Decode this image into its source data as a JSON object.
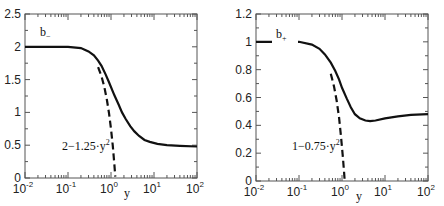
{
  "chart_data": [
    {
      "type": "line",
      "title": "",
      "xlabel": "y",
      "ylabel": "",
      "xscale": "log",
      "xlim": [
        0.01,
        100
      ],
      "ylim": [
        0,
        2.5
      ],
      "xticks": [
        "10^-2",
        "10^-1",
        "10^0",
        "10^1",
        "10^2"
      ],
      "yticks": [
        "0",
        "0.5",
        "1",
        "1.5",
        "2",
        "2.5"
      ],
      "curve_label": "b_",
      "series": [
        {
          "name": "b_",
          "style": "solid",
          "x": [
            0.01,
            0.05,
            0.1,
            0.2,
            0.3,
            0.4,
            0.5,
            0.6,
            0.75,
            0.9,
            1.2,
            1.5,
            1.8,
            2.2,
            2.8,
            3.5,
            4.5,
            6,
            8,
            12,
            20,
            40,
            100
          ],
          "y": [
            2.0,
            2.0,
            2.0,
            1.98,
            1.93,
            1.87,
            1.79,
            1.71,
            1.58,
            1.46,
            1.26,
            1.12,
            1.0,
            0.9,
            0.79,
            0.71,
            0.64,
            0.58,
            0.55,
            0.52,
            0.5,
            0.49,
            0.48
          ]
        },
        {
          "name": "2-1.25·y²",
          "style": "dashed",
          "x": [
            0.5,
            0.6,
            0.7,
            0.8,
            0.9,
            1.0,
            1.1,
            1.2,
            1.26
          ],
          "y": [
            1.69,
            1.55,
            1.39,
            1.2,
            0.99,
            0.75,
            0.49,
            0.2,
            0.02
          ]
        }
      ],
      "annotation": {
        "text": "2−1.25·y",
        "sup": "2"
      }
    },
    {
      "type": "line",
      "title": "",
      "xlabel": "y",
      "ylabel": "",
      "xscale": "log",
      "xlim": [
        0.01,
        100
      ],
      "ylim": [
        0,
        1.2
      ],
      "xticks": [
        "10^-2",
        "10^-1",
        "10^0",
        "10^1",
        "10^2"
      ],
      "yticks": [
        "0",
        "0.2",
        "0.4",
        "0.6",
        "0.8",
        "1",
        "1.2"
      ],
      "curve_label": "b+",
      "series": [
        {
          "name": "b+",
          "style": "solid",
          "x": [
            0.01,
            0.05,
            0.1,
            0.2,
            0.3,
            0.4,
            0.55,
            0.7,
            0.85,
            1.0,
            1.3,
            1.6,
            2.0,
            2.6,
            3.5,
            4.5,
            6,
            10,
            20,
            40,
            100
          ],
          "y": [
            1.0,
            1.0,
            1.0,
            0.98,
            0.95,
            0.91,
            0.85,
            0.79,
            0.73,
            0.67,
            0.59,
            0.53,
            0.48,
            0.45,
            0.435,
            0.43,
            0.435,
            0.45,
            0.465,
            0.475,
            0.48
          ]
        },
        {
          "name": "1-0.75·y²",
          "style": "dashed",
          "x": [
            0.55,
            0.65,
            0.75,
            0.85,
            0.95,
            1.05,
            1.12,
            1.155
          ],
          "y": [
            0.77,
            0.68,
            0.58,
            0.46,
            0.32,
            0.17,
            0.06,
            0.0
          ]
        }
      ],
      "annotation": {
        "text": "1−0.75·y",
        "sup": "2"
      }
    }
  ],
  "left": {
    "yticks": [
      "2.5",
      "2",
      "1.5",
      "1",
      "0.5",
      "0"
    ],
    "curve_label_main": "b",
    "curve_label_sub": "−",
    "annotation_main": "2−1.25·y",
    "annotation_sup": "2",
    "xlabel": "y",
    "xtick_base": "10",
    "xtick_exps": [
      "-2",
      "-1",
      "0",
      "1",
      "2"
    ]
  },
  "right": {
    "yticks": [
      "1.2",
      "1",
      "0.8",
      "0.6",
      "0.4",
      "0.2",
      "0"
    ],
    "curve_label_main": "b",
    "curve_label_sub": "+",
    "annotation_main": "1−0.75·y",
    "annotation_sup": "2",
    "xlabel": "y",
    "xtick_base": "10",
    "xtick_exps": [
      "-2",
      "-1",
      "0",
      "1",
      "2"
    ]
  },
  "colors": {
    "line": "#111111",
    "axis": "#444444",
    "background": "#ffffff"
  }
}
